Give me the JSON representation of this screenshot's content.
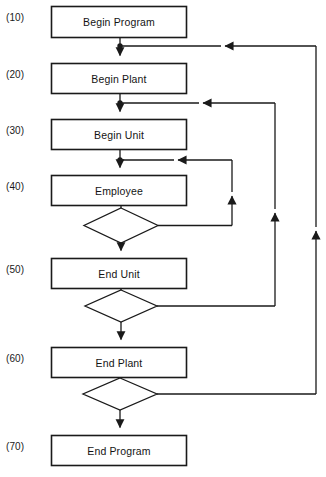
{
  "diagram": {
    "canvas": {
      "width": 326,
      "height": 477,
      "background": "#ffffff"
    },
    "line_color": "#1a1a1a",
    "text_color": "#141414",
    "nodes": [
      {
        "id": "begin_program",
        "step": "(10)",
        "label": "Begin Program",
        "shape": "process",
        "x": 51,
        "y": 6,
        "w": 136,
        "h": 32
      },
      {
        "id": "begin_plant",
        "step": "(20)",
        "label": "Begin Plant",
        "shape": "process",
        "x": 51,
        "y": 63,
        "w": 136,
        "h": 31
      },
      {
        "id": "begin_unit",
        "step": "(30)",
        "label": "Begin Unit",
        "shape": "process",
        "x": 51,
        "y": 119,
        "w": 136,
        "h": 31
      },
      {
        "id": "employee",
        "step": "(40)",
        "label": "Employee",
        "shape": "process",
        "x": 51,
        "y": 175,
        "w": 136,
        "h": 31
      },
      {
        "id": "end_unit",
        "step": "(50)",
        "label": "End Unit",
        "shape": "process",
        "x": 51,
        "y": 258,
        "w": 136,
        "h": 31
      },
      {
        "id": "end_plant",
        "step": "(60)",
        "label": "End Plant",
        "shape": "process",
        "x": 51,
        "y": 347,
        "w": 136,
        "h": 31
      },
      {
        "id": "end_program",
        "step": "(70)",
        "label": "End Program",
        "shape": "process",
        "x": 51,
        "y": 435,
        "w": 136,
        "h": 31
      }
    ],
    "decisions": [
      {
        "id": "employee_decision",
        "label": "",
        "cx": 121,
        "cy": 225,
        "rx": 37,
        "ry": 17
      },
      {
        "id": "unit_decision",
        "label": "",
        "cx": 121,
        "cy": 306,
        "rx": 36,
        "ry": 16
      },
      {
        "id": "plant_decision",
        "label": "",
        "cx": 120,
        "cy": 394,
        "rx": 37,
        "ry": 16
      }
    ],
    "step_numbers": [
      {
        "text": "(10)",
        "x": 6,
        "y": 17
      },
      {
        "text": "(20)",
        "x": 6,
        "y": 73
      },
      {
        "text": "(30)",
        "x": 6,
        "y": 129
      },
      {
        "text": "(40)",
        "x": 6,
        "y": 185
      },
      {
        "text": "(50)",
        "x": 6,
        "y": 268
      },
      {
        "text": "(60)",
        "x": 6,
        "y": 357
      },
      {
        "text": "(70)",
        "x": 6,
        "y": 445
      }
    ],
    "connectors": [
      {
        "id": "conn-program-to-plant",
        "from": "begin_program",
        "to": "begin_plant",
        "type": "straight-down"
      },
      {
        "id": "conn-plant-to-unit",
        "from": "begin_plant",
        "to": "begin_unit",
        "type": "straight-down"
      },
      {
        "id": "conn-unit-to-employee",
        "from": "begin_unit",
        "to": "employee",
        "type": "straight-down"
      },
      {
        "id": "conn-employee-to-decision",
        "from": "employee",
        "to": "employee_decision",
        "type": "straight-down"
      },
      {
        "id": "conn-employee-loop-back",
        "from": "employee_decision",
        "to": "employee",
        "type": "loop-right",
        "loop_x": 232
      },
      {
        "id": "conn-employee-decision-to-end-unit",
        "from": "employee_decision",
        "to": "end_unit",
        "type": "straight-down"
      },
      {
        "id": "conn-end-unit-to-decision",
        "from": "end_unit",
        "to": "unit_decision",
        "type": "straight-down"
      },
      {
        "id": "conn-unit-loop-back",
        "from": "unit_decision",
        "to": "begin_unit",
        "type": "loop-right",
        "loop_x": 275
      },
      {
        "id": "conn-unit-decision-to-end-plant",
        "from": "unit_decision",
        "to": "end_plant",
        "type": "straight-down"
      },
      {
        "id": "conn-end-plant-to-decision",
        "from": "end_plant",
        "to": "plant_decision",
        "type": "straight-down"
      },
      {
        "id": "conn-plant-loop-back",
        "from": "plant_decision",
        "to": "begin_plant",
        "type": "loop-right",
        "loop_x": 316
      },
      {
        "id": "conn-plant-decision-to-end-program",
        "from": "plant_decision",
        "to": "end_program",
        "type": "straight-down"
      }
    ]
  }
}
